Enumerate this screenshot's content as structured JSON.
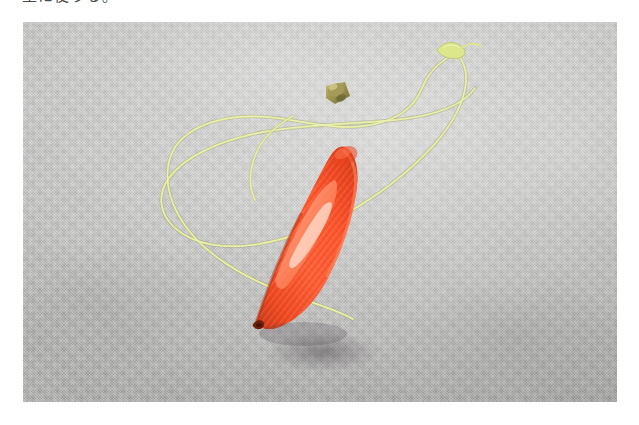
{
  "page": {
    "background_color": "#ffffff",
    "width": 639,
    "height": 425
  },
  "caption": {
    "text": "主に使うる。",
    "color": "#4a4a4a",
    "note_visible": "clipped top line of Japanese body text"
  },
  "photo": {
    "name": "plumb-bob-photograph",
    "x": 23,
    "y": 22,
    "width": 594,
    "height": 380,
    "background_color": "#b8b8b6",
    "background_description": "light grey woven fabric with fine checkered weave texture",
    "subject": "orange-red conical plumb bob on a yellow-green string"
  },
  "objects": {
    "cord": {
      "name": "plumb-bob-cord",
      "color": "#e3ec96",
      "highlight_color": "#f2f6c8",
      "shadow_color": "#b9bf7c",
      "description": "yellow-green chartreuse string looped in a large irregular coil across the upper two thirds of the frame, with a loose knotted end at the upper right",
      "thickness_px": 2
    },
    "knot": {
      "name": "cord-loose-end-knot",
      "color": "#d8e488",
      "position": "upper right of frame"
    },
    "ferrule": {
      "name": "brass-cap-ferrule",
      "color": "#9a9450",
      "highlight_color": "#c6bd78",
      "description": "small olive brass fitting joining cord to the top of the bob"
    },
    "bob": {
      "name": "plumb-bob-body",
      "color": "#ff5a34",
      "shadow_color": "#d13c1c",
      "highlight_color": "#ff8f68",
      "specular_color": "#ffd3c2",
      "tip_color": "#7a2410",
      "description": "bright orange-red plastic cone with ribbed faceted surface, tip pointing down-left",
      "shape": "cone"
    },
    "drop_shadow": {
      "name": "bob-drop-shadow",
      "color": "rgba(60,55,60,0.30)"
    }
  }
}
